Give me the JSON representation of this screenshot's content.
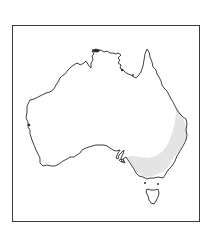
{
  "map": {
    "title": "Distribution map of Australia",
    "region": "Australia",
    "highlighted_area": "South-eastern Australia (eastern Queensland, New South Wales, Victoria, south-eastern South Australia)",
    "colors": {
      "frame": "#3a3a3a",
      "coastline": "#2a2a2a",
      "land": "#ffffff",
      "highlight": "#e4e4e4",
      "background": "#ffffff"
    }
  }
}
